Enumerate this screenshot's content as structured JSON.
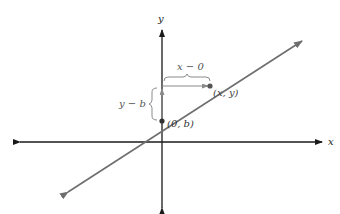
{
  "diagram": {
    "axes": {
      "x_label": "x",
      "y_label": "y",
      "color": "#1a1a1a"
    },
    "line": {
      "color": "#6e6e6e"
    },
    "points": [
      {
        "label": "(0, b)",
        "name": "y-intercept"
      },
      {
        "label": "(x, y)",
        "name": "general-point"
      }
    ],
    "brackets": {
      "horizontal_label": "x − 0",
      "vertical_label": "y − b",
      "color": "#8a8a8a"
    }
  }
}
